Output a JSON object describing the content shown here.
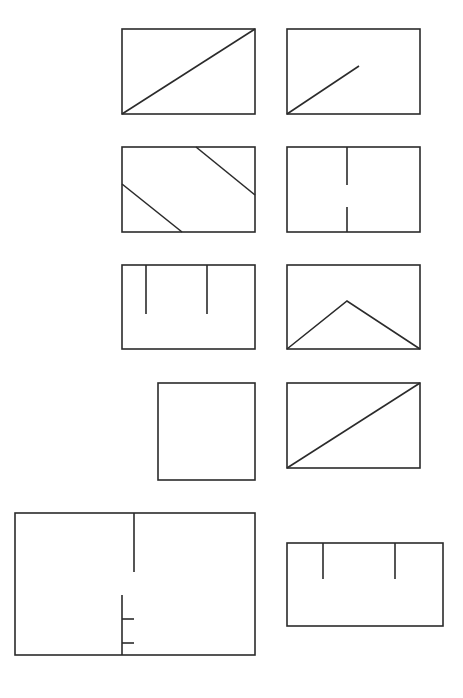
{
  "diagram": {
    "title": "",
    "stroke_color": "#2b2b2b",
    "background_color": "#ffffff",
    "panels": [
      {
        "id": 1,
        "name": "rect-full-diagonal",
        "rect": [
          122,
          29,
          133,
          85
        ],
        "lines": [
          [
            122,
            114,
            255,
            29
          ]
        ]
      },
      {
        "id": 2,
        "name": "rect-half-diagonal",
        "rect": [
          287,
          29,
          133,
          85
        ],
        "lines": [
          [
            287,
            114,
            359,
            66
          ]
        ]
      },
      {
        "id": 3,
        "name": "rect-two-parallel-slants",
        "rect": [
          122,
          147,
          133,
          85
        ],
        "lines": [
          [
            196,
            147,
            255,
            195
          ],
          [
            122,
            184,
            182,
            232
          ]
        ]
      },
      {
        "id": 4,
        "name": "rect-vertical-with-gap",
        "rect": [
          287,
          147,
          133,
          85
        ],
        "lines": [
          [
            347,
            147,
            347,
            185
          ],
          [
            347,
            207,
            347,
            232
          ]
        ]
      },
      {
        "id": 5,
        "name": "rect-two-top-stubs",
        "rect": [
          122,
          265,
          133,
          84
        ],
        "lines": [
          [
            146,
            265,
            146,
            314
          ],
          [
            207,
            265,
            207,
            314
          ]
        ]
      },
      {
        "id": 6,
        "name": "rect-chevron",
        "rect": [
          287,
          265,
          133,
          84
        ],
        "polylines": [
          [
            287,
            349,
            347,
            301,
            420,
            349
          ]
        ]
      },
      {
        "id": 7,
        "name": "square-empty",
        "rect": [
          158,
          383,
          97,
          97
        ],
        "lines": []
      },
      {
        "id": 8,
        "name": "rect-full-diagonal-2",
        "rect": [
          287,
          383,
          133,
          85
        ],
        "lines": [
          [
            287,
            468,
            420,
            383
          ]
        ]
      },
      {
        "id": 9,
        "name": "large-rect-offset-walls",
        "rect": [
          15,
          513,
          240,
          142
        ],
        "lines": [
          [
            134,
            513,
            134,
            572
          ],
          [
            122,
            595,
            122,
            655
          ],
          [
            122,
            619,
            134,
            619
          ],
          [
            122,
            643,
            134,
            643
          ]
        ]
      },
      {
        "id": 10,
        "name": "wide-rect-two-top-stubs",
        "rect": [
          287,
          543,
          156,
          83
        ],
        "lines": [
          [
            323,
            543,
            323,
            579
          ],
          [
            395,
            543,
            395,
            579
          ]
        ]
      }
    ]
  }
}
